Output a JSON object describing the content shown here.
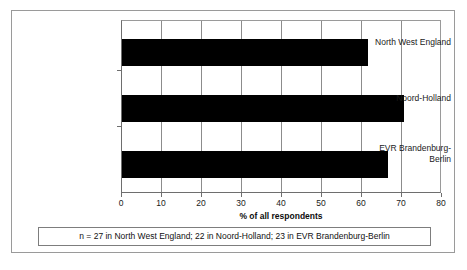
{
  "chart_data": {
    "type": "bar",
    "orientation": "horizontal",
    "title": "",
    "xlabel": "% of all respondents",
    "ylabel": "",
    "xlim": [
      0,
      80
    ],
    "xticks": [
      0,
      10,
      20,
      30,
      40,
      50,
      60,
      70,
      80
    ],
    "grid": true,
    "legend": false,
    "bar_color": "#000000",
    "categories": [
      "North West England",
      "Noord-Holland",
      "EVR Brandenburg-\nBerlin"
    ],
    "category_lines": [
      [
        "North West England"
      ],
      [
        "Noord-Holland"
      ],
      [
        "EVR Brandenburg-",
        "Berlin"
      ]
    ],
    "values": [
      62,
      71,
      67
    ],
    "series": [
      {
        "name": "% of all respondents",
        "values": [
          62,
          71,
          67
        ]
      }
    ],
    "annotations": [
      "n = 27 in North West England; 22 in Noord-Holland; 23 in EVR Brandenburg-Berlin"
    ]
  },
  "figure": {
    "footnote": "n = 27 in North West England; 22 in Noord-Holland; 23 in EVR Brandenburg-Berlin",
    "axis_title": "% of all respondents"
  },
  "colors": {
    "bar": "#000000",
    "gridline": "#8c8c8c",
    "axis": "#6e6e6e",
    "frame": "#9a9a9a",
    "background": "#ffffff",
    "text": "#1a1a1a"
  }
}
